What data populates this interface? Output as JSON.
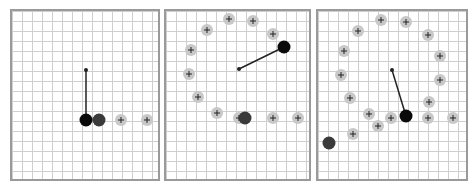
{
  "colors": {
    "grid": "#cfcfcf",
    "border": "#9a9a9a",
    "marker_fill": "#c8c8c8",
    "marker_cross": "#222222",
    "active": "#0a0a0a",
    "previous": "#3a3a3a",
    "arm": "#222222"
  },
  "panels": [
    {
      "name": "panel-1",
      "box": [
        10,
        9,
        150,
        172
      ],
      "pivot": [
        86,
        70
      ],
      "active": [
        86,
        120
      ],
      "previous": [
        99,
        120
      ],
      "markers": [
        [
          121,
          120
        ],
        [
          147,
          120
        ]
      ]
    },
    {
      "name": "panel-2",
      "box": [
        164,
        9,
        147,
        172
      ],
      "pivot": [
        239,
        69
      ],
      "active": [
        284,
        47
      ],
      "previous": [
        245,
        118
      ],
      "markers": [
        [
          229,
          19
        ],
        [
          253,
          21
        ],
        [
          207,
          30
        ],
        [
          273,
          34
        ],
        [
          191,
          50
        ],
        [
          189,
          74
        ],
        [
          198,
          97
        ],
        [
          217,
          113
        ],
        [
          239,
          118
        ],
        [
          273,
          118
        ],
        [
          298,
          118
        ]
      ]
    },
    {
      "name": "panel-3",
      "box": [
        316,
        9,
        152,
        172
      ],
      "pivot": [
        392,
        70
      ],
      "active": [
        406,
        116
      ],
      "previous": [
        329,
        143
      ],
      "markers": [
        [
          381,
          20
        ],
        [
          406,
          22
        ],
        [
          358,
          31
        ],
        [
          428,
          35
        ],
        [
          344,
          51
        ],
        [
          440,
          56
        ],
        [
          341,
          75
        ],
        [
          440,
          80
        ],
        [
          350,
          98
        ],
        [
          429,
          102
        ],
        [
          369,
          114
        ],
        [
          391,
          118
        ],
        [
          428,
          118
        ],
        [
          453,
          118
        ],
        [
          378,
          126
        ],
        [
          353,
          134
        ]
      ]
    }
  ]
}
